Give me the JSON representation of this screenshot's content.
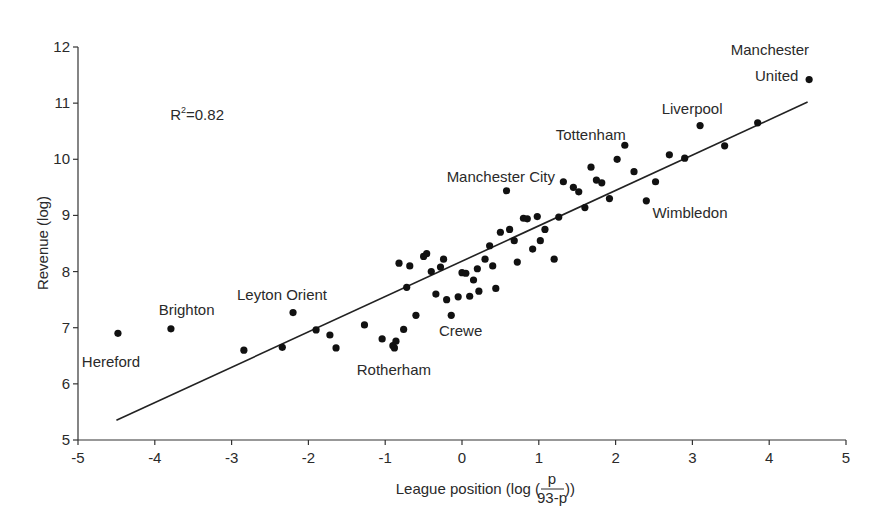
{
  "chart_data": {
    "type": "scatter",
    "title": "",
    "xlabel": "League position (log (p/(93-p)))",
    "xlabel_parts": {
      "prefix": "League position (log (",
      "numerator": "p",
      "denominator": "93-p",
      "suffix": "))"
    },
    "ylabel": "Revenue (log)",
    "xlim": [
      -5,
      5
    ],
    "ylim": [
      5,
      12
    ],
    "xticks": [
      "-5",
      "-4",
      "-3",
      "-2",
      "-1",
      "0",
      "1",
      "2",
      "3",
      "4",
      "5"
    ],
    "yticks": [
      "5",
      "6",
      "7",
      "8",
      "9",
      "10",
      "11",
      "12"
    ],
    "grid": false,
    "legend": null,
    "annotation": {
      "text_base": "R",
      "text_sup": "2",
      "text_rest": "=0.82",
      "x": -3.8,
      "y": 10.7
    },
    "regression_line": {
      "x1": -4.5,
      "y1": 5.35,
      "x2": 4.5,
      "y2": 11.02
    },
    "labels": [
      {
        "text": "Hereford",
        "x": -4.95,
        "y": 6.3,
        "anchor": "start"
      },
      {
        "text": "Brighton",
        "x": -3.95,
        "y": 7.22,
        "anchor": "start"
      },
      {
        "text": "Leyton Orient",
        "x": -2.93,
        "y": 7.5,
        "anchor": "start"
      },
      {
        "text": "Rotherham",
        "x": -1.37,
        "y": 6.15,
        "anchor": "start"
      },
      {
        "text": "Crewe",
        "x": -0.3,
        "y": 6.85,
        "anchor": "start"
      },
      {
        "text": "Manchester City",
        "x": -0.2,
        "y": 9.6,
        "anchor": "start"
      },
      {
        "text": "Tottenham",
        "x": 1.22,
        "y": 10.35,
        "anchor": "start"
      },
      {
        "text": "Liverpool",
        "x": 2.6,
        "y": 10.8,
        "anchor": "start"
      },
      {
        "text": "Wimbledon",
        "x": 2.48,
        "y": 8.95,
        "anchor": "start"
      },
      {
        "text": "Manchester",
        "x": 4.52,
        "y": 11.85,
        "anchor": "end"
      },
      {
        "text": "United",
        "x": 4.38,
        "y": 11.4,
        "anchor": "end"
      }
    ],
    "points": [
      {
        "x": -4.48,
        "y": 6.9,
        "club": "Hereford"
      },
      {
        "x": -3.79,
        "y": 6.98,
        "club": "Brighton"
      },
      {
        "x": -2.84,
        "y": 6.6
      },
      {
        "x": -2.2,
        "y": 7.27,
        "club": "Leyton Orient"
      },
      {
        "x": -2.34,
        "y": 6.65
      },
      {
        "x": -1.9,
        "y": 6.96
      },
      {
        "x": -1.72,
        "y": 6.87
      },
      {
        "x": -1.64,
        "y": 6.64
      },
      {
        "x": -1.27,
        "y": 7.05
      },
      {
        "x": -1.04,
        "y": 6.8
      },
      {
        "x": -0.9,
        "y": 6.68
      },
      {
        "x": -0.86,
        "y": 6.76
      },
      {
        "x": -0.88,
        "y": 6.64,
        "club": "Rotherham"
      },
      {
        "x": -0.76,
        "y": 6.97
      },
      {
        "x": -0.6,
        "y": 7.22
      },
      {
        "x": -0.82,
        "y": 8.15
      },
      {
        "x": -0.68,
        "y": 8.1
      },
      {
        "x": -0.72,
        "y": 7.72
      },
      {
        "x": -0.5,
        "y": 8.27
      },
      {
        "x": -0.46,
        "y": 8.32
      },
      {
        "x": -0.4,
        "y": 8.0
      },
      {
        "x": -0.28,
        "y": 8.08
      },
      {
        "x": -0.24,
        "y": 8.22
      },
      {
        "x": -0.34,
        "y": 7.6
      },
      {
        "x": -0.2,
        "y": 7.5
      },
      {
        "x": -0.14,
        "y": 7.22,
        "club": "Crewe"
      },
      {
        "x": -0.05,
        "y": 7.55
      },
      {
        "x": 0.0,
        "y": 7.98
      },
      {
        "x": 0.05,
        "y": 7.97
      },
      {
        "x": 0.1,
        "y": 7.56
      },
      {
        "x": 0.15,
        "y": 7.85
      },
      {
        "x": 0.2,
        "y": 8.05
      },
      {
        "x": 0.22,
        "y": 7.65
      },
      {
        "x": 0.3,
        "y": 8.22
      },
      {
        "x": 0.36,
        "y": 8.46
      },
      {
        "x": 0.4,
        "y": 8.1
      },
      {
        "x": 0.44,
        "y": 7.7
      },
      {
        "x": 0.5,
        "y": 8.7
      },
      {
        "x": 0.58,
        "y": 9.44,
        "club": "Manchester City"
      },
      {
        "x": 0.62,
        "y": 8.75
      },
      {
        "x": 0.68,
        "y": 8.55
      },
      {
        "x": 0.72,
        "y": 8.17
      },
      {
        "x": 0.8,
        "y": 8.95
      },
      {
        "x": 0.85,
        "y": 8.94
      },
      {
        "x": 0.92,
        "y": 8.4
      },
      {
        "x": 0.98,
        "y": 8.98
      },
      {
        "x": 1.02,
        "y": 8.55
      },
      {
        "x": 1.08,
        "y": 8.75
      },
      {
        "x": 1.2,
        "y": 8.22
      },
      {
        "x": 1.26,
        "y": 8.97
      },
      {
        "x": 1.32,
        "y": 9.6
      },
      {
        "x": 1.45,
        "y": 9.5
      },
      {
        "x": 1.52,
        "y": 9.42
      },
      {
        "x": 1.6,
        "y": 9.14
      },
      {
        "x": 1.68,
        "y": 9.86
      },
      {
        "x": 1.75,
        "y": 9.63
      },
      {
        "x": 1.82,
        "y": 9.58
      },
      {
        "x": 1.92,
        "y": 9.3
      },
      {
        "x": 2.02,
        "y": 10.0
      },
      {
        "x": 2.12,
        "y": 10.25
      },
      {
        "x": 2.24,
        "y": 9.78
      },
      {
        "x": 2.4,
        "y": 9.26,
        "club": "Wimbledon"
      },
      {
        "x": 2.52,
        "y": 9.6
      },
      {
        "x": 2.7,
        "y": 10.08
      },
      {
        "x": 2.9,
        "y": 10.02
      },
      {
        "x": 3.1,
        "y": 10.6,
        "club": "Liverpool"
      },
      {
        "x": 3.42,
        "y": 10.24
      },
      {
        "x": 3.85,
        "y": 10.65
      },
      {
        "x": 4.52,
        "y": 11.42,
        "club": "Manchester United"
      }
    ]
  }
}
